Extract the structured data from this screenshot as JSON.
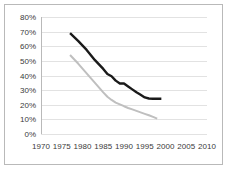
{
  "chart_data": {
    "type": "line",
    "title": "",
    "subtitle": "",
    "xlabel": "",
    "ylabel": "",
    "xlim": [
      1970,
      2010
    ],
    "ylim": [
      0,
      0.8
    ],
    "grid": "horizontal",
    "legend": "none",
    "x_tick_labels": [
      "1970",
      "1975",
      "1980",
      "1985",
      "1990",
      "1995",
      "2000",
      "2005",
      "2010"
    ],
    "x_tick_values": [
      1970,
      1975,
      1980,
      1985,
      1990,
      1995,
      2000,
      2005,
      2010
    ],
    "y_tick_labels": [
      "0%",
      "10%",
      "20%",
      "30%",
      "40%",
      "50%",
      "60%",
      "70%",
      "80%"
    ],
    "y_tick_values": [
      0,
      0.1,
      0.2,
      0.3,
      0.4,
      0.5,
      0.6,
      0.7,
      0.8
    ],
    "series": [
      {
        "name": "series-dark",
        "color": "#1a1a1a",
        "width": 2.4,
        "x": [
          1977,
          1979,
          1981,
          1983,
          1985,
          1986,
          1987,
          1988,
          1989,
          1990,
          1991,
          1992,
          1993,
          1994,
          1995,
          1996,
          1997,
          1998,
          1999
        ],
        "values": [
          0.69,
          0.635,
          0.575,
          0.505,
          0.445,
          0.41,
          0.395,
          0.365,
          0.345,
          0.345,
          0.325,
          0.305,
          0.285,
          0.268,
          0.25,
          0.243,
          0.241,
          0.241,
          0.241
        ]
      },
      {
        "name": "series-light",
        "color": "#bfbfbf",
        "width": 2.0,
        "x": [
          1977,
          1979,
          1981,
          1983,
          1985,
          1986,
          1987,
          1988,
          1989,
          1990,
          1991,
          1992,
          1993,
          1994,
          1995,
          1996,
          1997,
          1998
        ],
        "values": [
          0.54,
          0.48,
          0.415,
          0.35,
          0.285,
          0.255,
          0.233,
          0.215,
          0.203,
          0.19,
          0.178,
          0.168,
          0.158,
          0.148,
          0.138,
          0.128,
          0.117,
          0.105
        ]
      }
    ]
  }
}
